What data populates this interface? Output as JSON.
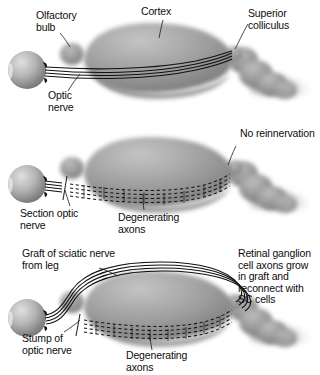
{
  "figure": {
    "type": "three-panel biological schematic",
    "colors": {
      "background": "#ffffff",
      "text": "#0d0d0d",
      "brain_mid": "#9a9a9a",
      "brain_light": "#c9c9c9",
      "brain_dark": "#6f6f6f",
      "eye_light": "#d2d2d2",
      "eye_dark": "#7b7b7b",
      "axon_line": "#141414",
      "leader_line": "#1a1a1a"
    }
  },
  "panels": [
    {
      "id": "panel-1",
      "name": "normal-projection",
      "labels": [
        {
          "name": "olfactory-bulb",
          "text": "Olfactory\nbulb"
        },
        {
          "name": "cortex",
          "text": "Cortex"
        },
        {
          "name": "superior-colliculus",
          "text": "Superior\ncolliculus"
        },
        {
          "name": "optic-nerve",
          "text": "Optic\nnerve"
        }
      ]
    },
    {
      "id": "panel-2",
      "name": "sectioned-nerve-degeneration",
      "labels": [
        {
          "name": "no-reinnervation",
          "text": "No reinnervation"
        },
        {
          "name": "section-optic-nerve",
          "text": "Section optic\nnerve"
        },
        {
          "name": "degenerating-axons",
          "text": "Degenerating\naxons"
        }
      ]
    },
    {
      "id": "panel-3",
      "name": "sciatic-nerve-graft",
      "labels": [
        {
          "name": "graft-of-sciatic-nerve",
          "text": "Graft of sciatic nerve\nfrom leg"
        },
        {
          "name": "retinal-ganglion-regrowth",
          "text": "Retinal ganglion\ncell axons grow\nin graft and\nreconnect with\nSC cells"
        },
        {
          "name": "stump-of-optic-nerve",
          "text": "Stump of\noptic nerve"
        },
        {
          "name": "degenerating-axons",
          "text": "Degenerating\naxons"
        }
      ]
    }
  ]
}
